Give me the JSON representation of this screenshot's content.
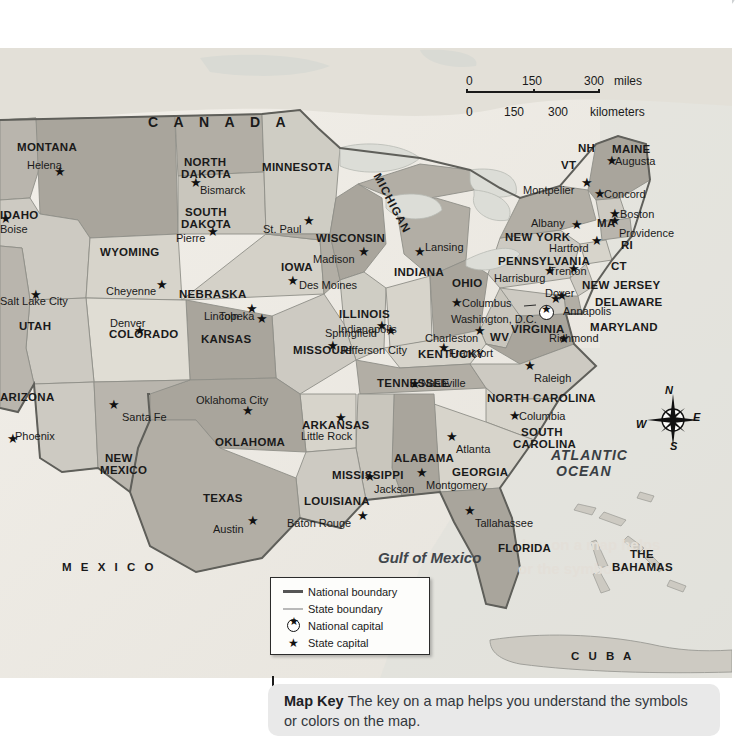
{
  "scale_bar": {
    "miles": {
      "ticks": [
        "0",
        "150",
        "300"
      ],
      "unit": "miles"
    },
    "kilometers": {
      "ticks": [
        "0",
        "150",
        "300"
      ],
      "unit": "kilometers"
    }
  },
  "compass": {
    "north": "N",
    "east": "E",
    "south": "S",
    "west": "W"
  },
  "map_key": {
    "items": [
      {
        "symbol": "national-boundary-line",
        "label": "National boundary"
      },
      {
        "symbol": "state-boundary-line",
        "label": "State boundary"
      },
      {
        "symbol": "national-capital-star-circle",
        "label": "National capital"
      },
      {
        "symbol": "state-capital-star",
        "label": "State capital"
      }
    ]
  },
  "caption": {
    "term": "Map Key",
    "text": "The key on a map helps you understand the symbols or colors on the map."
  },
  "countries": [
    {
      "name": "C A N A D A",
      "x": 148,
      "y": 67,
      "cls": "country"
    },
    {
      "name": "M E X I C O",
      "x": 62,
      "y": 513,
      "cls": "country sm"
    },
    {
      "name": "C U B A",
      "x": 571,
      "y": 602,
      "cls": "country sm"
    }
  ],
  "regions": [
    {
      "name": "THE",
      "x": 630,
      "y": 500,
      "cls": "state"
    },
    {
      "name": "BAHAMAS",
      "x": 612,
      "y": 513,
      "cls": "state"
    }
  ],
  "waters": [
    {
      "name": "Gulf of Mexico",
      "x": 378,
      "y": 502,
      "cls": "gulf"
    },
    {
      "name": "ATLANTIC",
      "x": 551,
      "y": 400,
      "cls": "ocean"
    },
    {
      "name": "OCEAN",
      "x": 556,
      "y": 416,
      "cls": "ocean"
    }
  ],
  "states": [
    {
      "name": "MONTANA",
      "x": 17,
      "y": 93,
      "cls": "state"
    },
    {
      "name": "NORTH",
      "x": 184,
      "y": 108,
      "cls": "state"
    },
    {
      "name": "DAKOTA",
      "x": 181,
      "y": 120,
      "cls": "state"
    },
    {
      "name": "SOUTH",
      "x": 185,
      "y": 158,
      "cls": "state"
    },
    {
      "name": "DAKOTA",
      "x": 181,
      "y": 170,
      "cls": "state"
    },
    {
      "name": "MINNESOTA",
      "x": 262,
      "y": 113,
      "cls": "state"
    },
    {
      "name": "WISCONSIN",
      "x": 316,
      "y": 184,
      "cls": "state"
    },
    {
      "name": "MICHIGAN",
      "x": 382,
      "y": 123,
      "cls": "rot-mich"
    },
    {
      "name": "WYOMING",
      "x": 100,
      "y": 198,
      "cls": "state"
    },
    {
      "name": "IOWA",
      "x": 281,
      "y": 213,
      "cls": "state"
    },
    {
      "name": "NEBRASKA",
      "x": 179,
      "y": 240,
      "cls": "state"
    },
    {
      "name": "ILLINOIS",
      "x": 339,
      "y": 260,
      "cls": "state"
    },
    {
      "name": "INDIANA",
      "x": 394,
      "y": 218,
      "cls": "state"
    },
    {
      "name": "OHIO",
      "x": 452,
      "y": 229,
      "cls": "state"
    },
    {
      "name": "PENNSYLVANIA",
      "x": 498,
      "y": 207,
      "cls": "state"
    },
    {
      "name": "UTAH",
      "x": 19,
      "y": 272,
      "cls": "state"
    },
    {
      "name": "COLORADO",
      "x": 109,
      "y": 280,
      "cls": "state"
    },
    {
      "name": "KANSAS",
      "x": 201,
      "y": 285,
      "cls": "state"
    },
    {
      "name": "MISSOURI",
      "x": 293,
      "y": 296,
      "cls": "state"
    },
    {
      "name": "KENTUCKY",
      "x": 418,
      "y": 300,
      "cls": "state"
    },
    {
      "name": "WV",
      "x": 490,
      "y": 283,
      "cls": "state"
    },
    {
      "name": "VIRGINIA",
      "x": 511,
      "y": 275,
      "cls": "state"
    },
    {
      "name": "TENNESSEE",
      "x": 377,
      "y": 329,
      "cls": "state"
    },
    {
      "name": "NORTH CAROLINA",
      "x": 487,
      "y": 344,
      "cls": "state"
    },
    {
      "name": "SOUTH",
      "x": 521,
      "y": 378,
      "cls": "state"
    },
    {
      "name": "CAROLINA",
      "x": 513,
      "y": 390,
      "cls": "state"
    },
    {
      "name": "ARKANSAS",
      "x": 302,
      "y": 371,
      "cls": "state"
    },
    {
      "name": "OKLAHOMA",
      "x": 215,
      "y": 388,
      "cls": "state"
    },
    {
      "name": "ARIZONA",
      "x": 0,
      "y": 343,
      "cls": "state"
    },
    {
      "name": "NEW",
      "x": 105,
      "y": 404,
      "cls": "state"
    },
    {
      "name": "MEXICO",
      "x": 100,
      "y": 416,
      "cls": "state"
    },
    {
      "name": "TEXAS",
      "x": 203,
      "y": 444,
      "cls": "state"
    },
    {
      "name": "LOUISIANA",
      "x": 304,
      "y": 447,
      "cls": "state"
    },
    {
      "name": "MISSISSIPPI",
      "x": 332,
      "y": 421,
      "cls": "state"
    },
    {
      "name": "ALABAMA",
      "x": 394,
      "y": 404,
      "cls": "state"
    },
    {
      "name": "GEORGIA",
      "x": 452,
      "y": 418,
      "cls": "state"
    },
    {
      "name": "FLORIDA",
      "x": 498,
      "y": 494,
      "cls": "state"
    },
    {
      "name": "IDAHO",
      "x": 0,
      "y": 161,
      "cls": "state"
    },
    {
      "name": "NEW YORK",
      "x": 505,
      "y": 183,
      "cls": "state"
    },
    {
      "name": "NEW JERSEY",
      "x": 582,
      "y": 231,
      "cls": "state"
    },
    {
      "name": "DELAWARE",
      "x": 595,
      "y": 248,
      "cls": "state"
    },
    {
      "name": "MARYLAND",
      "x": 590,
      "y": 273,
      "cls": "state"
    },
    {
      "name": "MAINE",
      "x": 612,
      "y": 95,
      "cls": "state"
    },
    {
      "name": "NH",
      "x": 578,
      "y": 94,
      "cls": "state"
    },
    {
      "name": "VT",
      "x": 561,
      "y": 111,
      "cls": "state"
    },
    {
      "name": "MA",
      "x": 597,
      "y": 169,
      "cls": "state"
    },
    {
      "name": "RI",
      "x": 621,
      "y": 191,
      "cls": "state"
    },
    {
      "name": "CT",
      "x": 611,
      "y": 212,
      "cls": "state"
    }
  ],
  "capitals": [
    {
      "name": "Helena",
      "lx": 27,
      "ly": 112,
      "mx": 60,
      "my": 131,
      "cls": "city"
    },
    {
      "name": "Bismarck",
      "lx": 200,
      "ly": 137,
      "mx": 196,
      "my": 142,
      "cls": "city"
    },
    {
      "name": "Pierre",
      "lx": 176,
      "ly": 185,
      "mx": 213,
      "my": 191,
      "cls": "city"
    },
    {
      "name": "St. Paul",
      "lx": 263,
      "ly": 176,
      "mx": 309,
      "my": 180,
      "cls": "city"
    },
    {
      "name": "Madison",
      "lx": 313,
      "ly": 206,
      "mx": 364,
      "my": 211,
      "cls": "city"
    },
    {
      "name": "Lansing",
      "lx": 425,
      "ly": 194,
      "mx": 420,
      "my": 211,
      "cls": "city"
    },
    {
      "name": "Des Moines",
      "lx": 299,
      "ly": 232,
      "mx": 293,
      "my": 240,
      "cls": "city"
    },
    {
      "name": "Cheyenne",
      "lx": 106,
      "ly": 238,
      "mx": 162,
      "my": 244,
      "cls": "city"
    },
    {
      "name": "Lincoln",
      "lx": 204,
      "ly": 263,
      "mx": 252,
      "my": 268,
      "cls": "city"
    },
    {
      "name": "Denver",
      "lx": 110,
      "ly": 270,
      "mx": 140,
      "my": 290,
      "cls": "city"
    },
    {
      "name": "Topeka",
      "lx": 219,
      "ly": 263,
      "mx": 262,
      "my": 278,
      "cls": "city"
    },
    {
      "name": "Springfield",
      "lx": 325,
      "ly": 280,
      "mx": 382,
      "my": 285,
      "cls": "city"
    },
    {
      "name": "Jefferson City",
      "lx": 340,
      "ly": 297,
      "mx": 333,
      "my": 305,
      "cls": "city"
    },
    {
      "name": "Indianapolis",
      "lx": 338,
      "ly": 276,
      "mx": 391,
      "my": 290,
      "cls": "city"
    },
    {
      "name": "Columbus",
      "lx": 462,
      "ly": 250,
      "mx": 457,
      "my": 262,
      "cls": "city"
    },
    {
      "name": "Charleston",
      "lx": 425,
      "ly": 285,
      "mx": 480,
      "my": 290,
      "cls": "city"
    },
    {
      "name": "Frankfort",
      "lx": 449,
      "ly": 300,
      "mx": 444,
      "my": 307,
      "cls": "city"
    },
    {
      "name": "Nashville",
      "lx": 421,
      "ly": 330,
      "mx": 415,
      "my": 343,
      "cls": "city"
    },
    {
      "name": "Salt Lake City",
      "lx": 0,
      "ly": 248,
      "mx": 36,
      "my": 254,
      "cls": "city"
    },
    {
      "name": "Santa Fe",
      "lx": 122,
      "ly": 364,
      "mx": 114,
      "my": 364,
      "cls": "city"
    },
    {
      "name": "Phoenix",
      "lx": 15,
      "ly": 383,
      "mx": 13,
      "my": 398,
      "cls": "city"
    },
    {
      "name": "Oklahoma City",
      "lx": 196,
      "ly": 347,
      "mx": 248,
      "my": 370,
      "cls": "city"
    },
    {
      "name": "Little Rock",
      "lx": 301,
      "ly": 383,
      "mx": 341,
      "my": 377,
      "cls": "city"
    },
    {
      "name": "Austin",
      "lx": 213,
      "ly": 476,
      "mx": 253,
      "my": 480,
      "cls": "city"
    },
    {
      "name": "Baton Rouge",
      "lx": 287,
      "ly": 470,
      "mx": 363,
      "my": 475,
      "cls": "city"
    },
    {
      "name": "Jackson",
      "lx": 374,
      "ly": 436,
      "mx": 370,
      "my": 436,
      "cls": "city"
    },
    {
      "name": "Montgomery",
      "lx": 426,
      "ly": 432,
      "mx": 422,
      "my": 432,
      "cls": "city"
    },
    {
      "name": "Atlanta",
      "lx": 456,
      "ly": 396,
      "mx": 452,
      "my": 396,
      "cls": "city"
    },
    {
      "name": "Tallahassee",
      "lx": 475,
      "ly": 470,
      "mx": 470,
      "my": 470,
      "cls": "city"
    },
    {
      "name": "Columbia",
      "lx": 519,
      "ly": 363,
      "mx": 515,
      "my": 375,
      "cls": "city"
    },
    {
      "name": "Raleigh",
      "lx": 534,
      "ly": 325,
      "mx": 530,
      "my": 325,
      "cls": "city"
    },
    {
      "name": "Richmond",
      "lx": 549,
      "ly": 285,
      "mx": 564,
      "my": 298,
      "cls": "city"
    },
    {
      "name": "Annapolis",
      "lx": 563,
      "ly": 258,
      "mx": 556,
      "my": 258,
      "cls": "city"
    },
    {
      "name": "Dover",
      "lx": 545,
      "ly": 240,
      "mx": 562,
      "my": 255,
      "cls": "city"
    },
    {
      "name": "Trenton",
      "lx": 549,
      "ly": 218,
      "mx": 574,
      "my": 228,
      "cls": "city"
    },
    {
      "name": "Harrisburg",
      "lx": 494,
      "ly": 225,
      "mx": 550,
      "my": 230,
      "cls": "city"
    },
    {
      "name": "Albany",
      "lx": 531,
      "ly": 170,
      "mx": 577,
      "my": 184,
      "cls": "city"
    },
    {
      "name": "Hartford",
      "lx": 549,
      "ly": 195,
      "mx": 597,
      "my": 200,
      "cls": "city"
    },
    {
      "name": "Providence",
      "lx": 619,
      "ly": 180,
      "mx": 615,
      "my": 180,
      "cls": "city"
    },
    {
      "name": "Boston",
      "lx": 620,
      "ly": 161,
      "mx": 615,
      "my": 173,
      "cls": "city"
    },
    {
      "name": "Concord",
      "lx": 604,
      "ly": 141,
      "mx": 600,
      "my": 153,
      "cls": "city"
    },
    {
      "name": "Augusta",
      "lx": 615,
      "ly": 108,
      "mx": 612,
      "my": 120,
      "cls": "city"
    },
    {
      "name": "Montpelier",
      "lx": 523,
      "ly": 137,
      "mx": 587,
      "my": 142,
      "cls": "city"
    },
    {
      "name": "Boise",
      "lx": 0,
      "ly": 176,
      "mx": 6,
      "my": 178,
      "cls": "city"
    }
  ],
  "national_capital": {
    "name": "Washington, D.C.",
    "lx": 451,
    "ly": 266,
    "mx": 539,
    "my": 257
  }
}
